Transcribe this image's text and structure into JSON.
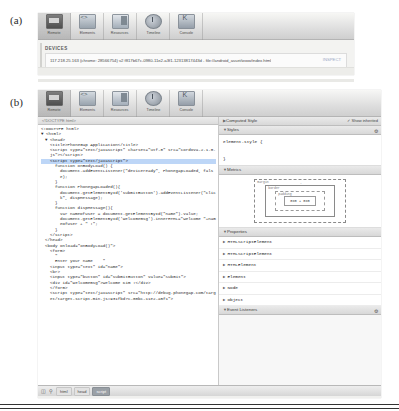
{
  "figure": {
    "label_a": "(a)",
    "label_b": "(b)"
  },
  "devtools": {
    "toolbar": [
      {
        "label": "Remote",
        "icon": "remote-icon",
        "selected": true
      },
      {
        "label": "Elements",
        "icon": "elements-icon",
        "selected": false
      },
      {
        "label": "Resources",
        "icon": "resources-icon",
        "selected": false
      },
      {
        "label": "Timeline",
        "icon": "timeline-icon",
        "selected": false
      },
      {
        "label": "Console",
        "icon": "console-icon",
        "selected": false
      }
    ]
  },
  "panel_a": {
    "section_title": "DEVICES",
    "device_entry": "117.218.25.163 (chrome: 28566754) v2 f817b67c-0980-11e2-a3f1-12313817443d - file://android_asset/www/index.html",
    "device_action": "INSPECT"
  },
  "panel_b": {
    "subbar_note": "<!DOCTYPE html>",
    "code_lines": [
      {
        "indent": 0,
        "text": "<!DOCTYPE html>",
        "selected": false
      },
      {
        "indent": 0,
        "text": "▼ <html>",
        "selected": false
      },
      {
        "indent": 1,
        "text": "▼ <head>",
        "selected": false
      },
      {
        "indent": 2,
        "text": "<title>PhoneGap Application</title>",
        "selected": false
      },
      {
        "indent": 2,
        "text": "<script type=\"text/javascript\" charset=\"utf-8\" src=\"cordova-2.1.0.js\"></script>",
        "selected": false
      },
      {
        "indent": 2,
        "text": "<script type=\"text/javascript\">",
        "selected": true
      },
      {
        "indent": 3,
        "text": "function onBodyLoad() {",
        "selected": false
      },
      {
        "indent": 4,
        "text": "document.addEventListener(\"deviceready\", PhonegapLoaded, false);",
        "selected": false
      },
      {
        "indent": 3,
        "text": "}",
        "selected": false
      },
      {
        "indent": 3,
        "text": "function PhonegapLoaded(){",
        "selected": false
      },
      {
        "indent": 4,
        "text": "document.getElementById('submitButton').addEventListener(\"click\", dispMessage);",
        "selected": false
      },
      {
        "indent": 3,
        "text": "}",
        "selected": false
      },
      {
        "indent": 3,
        "text": "function dispMessage(){",
        "selected": false
      },
      {
        "indent": 4,
        "text": "var nameOfUser = document.getElementById(\"name\").value;",
        "selected": false
      },
      {
        "indent": 4,
        "text": "document.getElementById('welcomemsg').innerHTML=\"Welcome \"+nameOfUser + \" !\";",
        "selected": false
      },
      {
        "indent": 3,
        "text": "}",
        "selected": false
      },
      {
        "indent": 2,
        "text": "</script>",
        "selected": false
      },
      {
        "indent": 1,
        "text": "</head>",
        "selected": false
      },
      {
        "indent": 1,
        "text": "<body onload=\"onBodyLoad()\">",
        "selected": false
      },
      {
        "indent": 2,
        "text": "<form>",
        "selected": false
      },
      {
        "indent": 3,
        "text": "\"",
        "selected": false
      },
      {
        "indent": 3,
        "text": "Enter your name    \"",
        "selected": false
      },
      {
        "indent": 2,
        "text": "<input type=\"text\" id=\"name\">",
        "selected": false
      },
      {
        "indent": 2,
        "text": "<br>",
        "selected": false
      },
      {
        "indent": 2,
        "text": "<input type=\"button\" id=\"submitButton\" value=\"Submit\">",
        "selected": false
      },
      {
        "indent": 2,
        "text": "<div id=\"welcomemsg\">Welcome Kim !</div>",
        "selected": false
      },
      {
        "indent": 2,
        "text": "</form>",
        "selected": false
      },
      {
        "indent": 2,
        "text": "<script type=\"text/javascript\" src=\"http://debug.phonegap.com/target/target-script-min.js#931fbd7c-00bc-11e2-a5f1\">",
        "selected": false
      }
    ],
    "sidebar": {
      "computed_style_title": "Computed Style",
      "show_inherited_label": "Show inherited",
      "styles_title": "Styles",
      "element_style_rule": "element.style {",
      "element_style_close": "}",
      "metrics_title": "Metrics",
      "metrics": {
        "margin_label": "margin",
        "border_label": "border",
        "padding_label": "padding",
        "content": "0x0 + 0x0",
        "top": "-",
        "right": "-",
        "bottom": "-",
        "left": "-"
      },
      "properties_title": "Properties",
      "properties": [
        "HTMLScriptElement",
        "HTMLScriptElement",
        "HTMLElement",
        "Element",
        "Node",
        "Object"
      ],
      "event_listeners_title": "Event Listeners"
    },
    "status_bar": {
      "dock_icon": "dock-icon",
      "search_icon": "search-icon",
      "crumbs": [
        {
          "label": "html",
          "active": false
        },
        {
          "label": "head",
          "active": false
        },
        {
          "label": "script",
          "active": true
        }
      ]
    }
  }
}
